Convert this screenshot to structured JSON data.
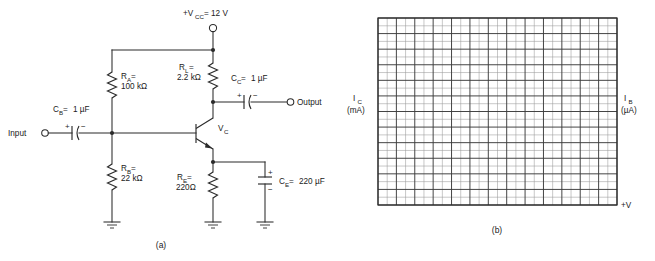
{
  "figure": {
    "panel_a": {
      "caption": "(a)",
      "supply": {
        "label_main": "+V",
        "label_sub": "CC",
        "label_tail": " = 12 V"
      },
      "input_terminal": {
        "label": "Input"
      },
      "output_terminal": {
        "label": "Output"
      },
      "transistor": {
        "node_label_main": "V",
        "node_label_sub": "C",
        "type": "npn"
      },
      "components": [
        {
          "id": "RA",
          "name_main": "R",
          "name_sub": "A",
          "eq": " =",
          "value": "100 kΩ",
          "kind": "resistor"
        },
        {
          "id": "RB",
          "name_main": "R",
          "name_sub": "B",
          "eq": " =",
          "value": "22 kΩ",
          "kind": "resistor"
        },
        {
          "id": "RL",
          "name_main": "R",
          "name_sub": "L",
          "eq": " =",
          "value": "2.2 kΩ",
          "kind": "resistor"
        },
        {
          "id": "RE",
          "name_main": "R",
          "name_sub": "E",
          "eq": " =",
          "value": "220Ω",
          "kind": "resistor"
        },
        {
          "id": "CB",
          "name_main": "C",
          "name_sub": "B",
          "eq": " = ",
          "value": "1 µF",
          "kind": "capacitor-polarized"
        },
        {
          "id": "CC",
          "name_main": "C",
          "name_sub": "C",
          "eq": " = ",
          "value": "1 µF",
          "kind": "capacitor-polarized"
        },
        {
          "id": "CE",
          "name_main": "C",
          "name_sub": "E",
          "eq": " = ",
          "value": "220 µF",
          "kind": "capacitor-polarized"
        }
      ],
      "polarity_marks": {
        "plus": "+",
        "minus": "−"
      },
      "ground_count": 3
    },
    "panel_b": {
      "caption": "(b)",
      "y_axis_left": {
        "symbol_main": "I",
        "symbol_sub": "C",
        "unit": "(mA)"
      },
      "y_axis_right": {
        "symbol_main": "I",
        "symbol_sub": "B",
        "unit": "(µA)"
      },
      "x_axis_label": "+V",
      "grid": {
        "columns": 13,
        "rows": 12,
        "minor_per_cell": 2
      }
    }
  },
  "colors": {
    "ink": "#2b2b2b",
    "grid_major": "#3b3b3b",
    "grid_minor": "#9a9a9a",
    "background": "#ffffff"
  }
}
